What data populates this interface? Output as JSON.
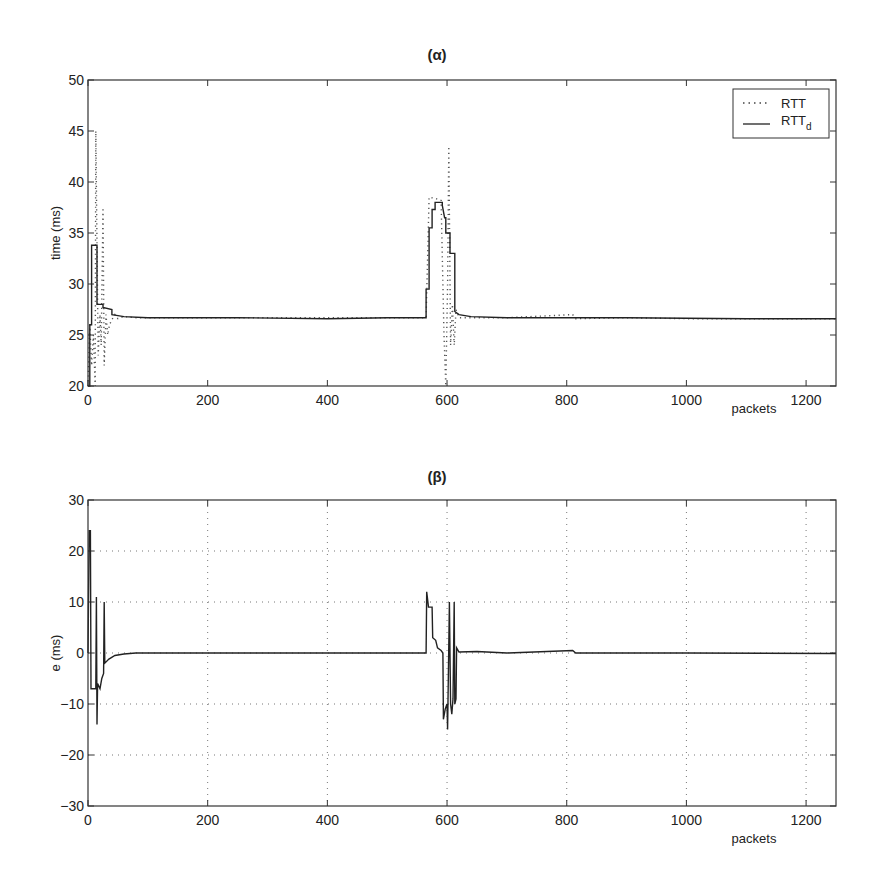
{
  "chart_data": [
    {
      "id": "alpha",
      "type": "line",
      "title": "(α)",
      "xlabel": "packets",
      "ylabel": "time (ms)",
      "xlim": [
        0,
        1250
      ],
      "ylim": [
        20,
        50
      ],
      "xticks": [
        0,
        200,
        400,
        600,
        800,
        1000,
        1200
      ],
      "yticks": [
        20,
        25,
        30,
        35,
        40,
        45,
        50
      ],
      "grid": false,
      "legend": {
        "position": "upper right",
        "entries": [
          {
            "label": "RTT",
            "sub": "",
            "style": "dotted"
          },
          {
            "label": "RTT",
            "sub": "d",
            "style": "solid"
          }
        ]
      },
      "series": [
        {
          "name": "RTT",
          "style": "dotted",
          "points": [
            [
              0,
              20
            ],
            [
              3,
              26
            ],
            [
              6,
              22
            ],
            [
              9,
              25
            ],
            [
              12,
              20
            ],
            [
              13,
              45
            ],
            [
              15,
              34
            ],
            [
              17,
              23
            ],
            [
              20,
              27
            ],
            [
              22,
              24
            ],
            [
              25,
              37.5
            ],
            [
              27,
              22
            ],
            [
              30,
              27
            ],
            [
              33,
              25
            ],
            [
              36,
              26
            ],
            [
              40,
              26.5
            ],
            [
              45,
              27
            ],
            [
              50,
              26.6
            ],
            [
              60,
              26.8
            ],
            [
              80,
              26.7
            ],
            [
              150,
              26.7
            ],
            [
              300,
              26.7
            ],
            [
              450,
              26.7
            ],
            [
              565,
              26.7
            ],
            [
              570,
              38.5
            ],
            [
              580,
              38.4
            ],
            [
              590,
              38.2
            ],
            [
              595,
              25
            ],
            [
              598,
              20
            ],
            [
              601,
              30
            ],
            [
              603,
              43.5
            ],
            [
              606,
              24
            ],
            [
              609,
              28
            ],
            [
              612,
              24
            ],
            [
              615,
              27.5
            ],
            [
              620,
              26.7
            ],
            [
              700,
              26.7
            ],
            [
              810,
              27
            ],
            [
              815,
              26.6
            ],
            [
              900,
              26.7
            ],
            [
              1000,
              26.6
            ],
            [
              1100,
              26.6
            ],
            [
              1250,
              26.6
            ]
          ]
        },
        {
          "name": "RTT_d",
          "style": "solid",
          "points": [
            [
              0,
              20
            ],
            [
              3,
              20
            ],
            [
              3,
              26
            ],
            [
              6,
              26
            ],
            [
              6,
              33.8
            ],
            [
              15,
              33.8
            ],
            [
              15,
              28
            ],
            [
              25,
              28
            ],
            [
              25,
              27.7
            ],
            [
              40,
              27.5
            ],
            [
              40,
              27
            ],
            [
              50,
              26.9
            ],
            [
              60,
              26.8
            ],
            [
              100,
              26.7
            ],
            [
              250,
              26.7
            ],
            [
              400,
              26.6
            ],
            [
              500,
              26.7
            ],
            [
              565,
              26.7
            ],
            [
              565,
              29.5
            ],
            [
              570,
              29.5
            ],
            [
              570,
              35.5
            ],
            [
              575,
              35.5
            ],
            [
              575,
              37.3
            ],
            [
              580,
              37.3
            ],
            [
              580,
              38
            ],
            [
              592,
              38
            ],
            [
              592,
              37.7
            ],
            [
              596,
              36.5
            ],
            [
              598,
              36.5
            ],
            [
              598,
              35
            ],
            [
              605,
              35
            ],
            [
              605,
              33
            ],
            [
              613,
              33
            ],
            [
              613,
              27.3
            ],
            [
              620,
              27
            ],
            [
              640,
              26.8
            ],
            [
              700,
              26.7
            ],
            [
              900,
              26.7
            ],
            [
              1100,
              26.6
            ],
            [
              1250,
              26.6
            ]
          ]
        }
      ]
    },
    {
      "id": "beta",
      "type": "line",
      "title": "(β)",
      "xlabel": "packets",
      "ylabel": "e (ms)",
      "xlim": [
        0,
        1250
      ],
      "ylim": [
        -30,
        30
      ],
      "xticks": [
        0,
        200,
        400,
        600,
        800,
        1000,
        1200
      ],
      "yticks": [
        -30,
        -20,
        -10,
        0,
        10,
        20,
        30
      ],
      "grid": true,
      "series": [
        {
          "name": "e",
          "style": "solid",
          "points": [
            [
              0,
              0
            ],
            [
              2,
              24
            ],
            [
              4,
              24
            ],
            [
              5,
              -7
            ],
            [
              13,
              -7
            ],
            [
              14,
              11
            ],
            [
              15,
              -14
            ],
            [
              16,
              -6
            ],
            [
              20,
              -7
            ],
            [
              23,
              -5
            ],
            [
              26,
              -4
            ],
            [
              27,
              10
            ],
            [
              28,
              -2
            ],
            [
              35,
              -1.2
            ],
            [
              45,
              -0.5
            ],
            [
              60,
              -0.2
            ],
            [
              80,
              0
            ],
            [
              200,
              0
            ],
            [
              400,
              0
            ],
            [
              565,
              0
            ],
            [
              566,
              12
            ],
            [
              569,
              9
            ],
            [
              575,
              9
            ],
            [
              576,
              3
            ],
            [
              581,
              2.5
            ],
            [
              584,
              1
            ],
            [
              590,
              0.5
            ],
            [
              593,
              0
            ],
            [
              594,
              -13
            ],
            [
              597,
              -11
            ],
            [
              600,
              -10
            ],
            [
              601,
              -15
            ],
            [
              604,
              10
            ],
            [
              606,
              -10
            ],
            [
              608,
              -12
            ],
            [
              610,
              -9
            ],
            [
              612,
              10
            ],
            [
              613,
              -10
            ],
            [
              615,
              -9
            ],
            [
              616,
              1
            ],
            [
              620,
              0.2
            ],
            [
              650,
              0.3
            ],
            [
              700,
              0
            ],
            [
              810,
              0.5
            ],
            [
              815,
              0
            ],
            [
              1000,
              0
            ],
            [
              1250,
              -0.1
            ]
          ]
        }
      ]
    }
  ],
  "layout": {
    "alpha": {
      "left": 88,
      "right": 836,
      "top": 80,
      "bottom": 386
    },
    "beta": {
      "left": 88,
      "right": 836,
      "top": 500,
      "bottom": 806
    }
  }
}
